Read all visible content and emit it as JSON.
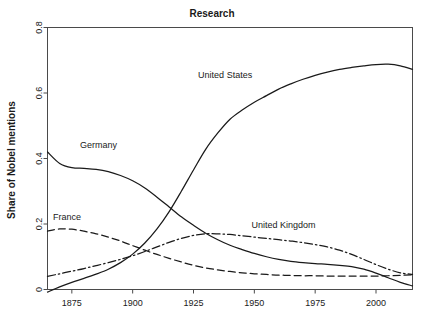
{
  "chart_data": {
    "type": "line",
    "title": "Research",
    "xlabel": "",
    "ylabel": "Share of Nobel mentions",
    "xlim": [
      1865,
      2015
    ],
    "ylim": [
      0,
      0.8
    ],
    "xticks": [
      1875,
      1900,
      1925,
      1950,
      1975,
      2000
    ],
    "xtick_labels": [
      "1875",
      "1900",
      "1925",
      "1950",
      "1975",
      "2000"
    ],
    "yticks": [
      0,
      0.2,
      0.4,
      0.6,
      0.8
    ],
    "ytick_labels": [
      "0",
      "0.2",
      "0.4",
      "0.6",
      "0.8"
    ],
    "grid": false,
    "legend": "inline-annotations",
    "x": [
      1865,
      1870,
      1875,
      1880,
      1885,
      1890,
      1895,
      1900,
      1905,
      1910,
      1915,
      1920,
      1925,
      1930,
      1935,
      1940,
      1945,
      1950,
      1955,
      1960,
      1965,
      1970,
      1975,
      1980,
      1985,
      1990,
      1995,
      2000,
      2005,
      2010,
      2015
    ],
    "series": [
      {
        "name": "United States",
        "style": "solid",
        "label_x": 1938,
        "label_y": 0.645,
        "values": [
          -0.008,
          0.008,
          0.022,
          0.034,
          0.047,
          0.062,
          0.082,
          0.108,
          0.142,
          0.185,
          0.238,
          0.3,
          0.365,
          0.428,
          0.478,
          0.52,
          0.548,
          0.572,
          0.592,
          0.612,
          0.628,
          0.642,
          0.654,
          0.664,
          0.672,
          0.678,
          0.683,
          0.687,
          0.688,
          0.683,
          0.672
        ]
      },
      {
        "name": "Germany",
        "style": "solid",
        "label_x": 1886,
        "label_y": 0.432,
        "values": [
          0.42,
          0.385,
          0.372,
          0.37,
          0.367,
          0.36,
          0.348,
          0.332,
          0.31,
          0.282,
          0.252,
          0.222,
          0.196,
          0.172,
          0.152,
          0.135,
          0.122,
          0.11,
          0.1,
          0.092,
          0.086,
          0.082,
          0.079,
          0.077,
          0.074,
          0.07,
          0.062,
          0.05,
          0.036,
          0.022,
          0.011
        ]
      },
      {
        "name": "France",
        "style": "dashed",
        "label_x": 1873,
        "label_y": 0.213,
        "values": [
          0.178,
          0.185,
          0.184,
          0.178,
          0.17,
          0.16,
          0.148,
          0.134,
          0.12,
          0.107,
          0.095,
          0.084,
          0.074,
          0.066,
          0.06,
          0.055,
          0.051,
          0.048,
          0.046,
          0.044,
          0.043,
          0.042,
          0.042,
          0.041,
          0.041,
          0.041,
          0.041,
          0.041,
          0.042,
          0.043,
          0.045
        ]
      },
      {
        "name": "United Kingdom",
        "style": "dashdot",
        "label_x": 1962,
        "label_y": 0.188,
        "values": [
          0.04,
          0.048,
          0.056,
          0.064,
          0.073,
          0.082,
          0.092,
          0.103,
          0.116,
          0.13,
          0.144,
          0.156,
          0.165,
          0.17,
          0.17,
          0.168,
          0.164,
          0.16,
          0.156,
          0.152,
          0.148,
          0.143,
          0.137,
          0.13,
          0.12,
          0.107,
          0.092,
          0.076,
          0.062,
          0.051,
          0.046
        ]
      }
    ]
  },
  "colors": {
    "line": "#1a1a1a",
    "axis": "#4a4a4a",
    "background": "#ffffff"
  }
}
